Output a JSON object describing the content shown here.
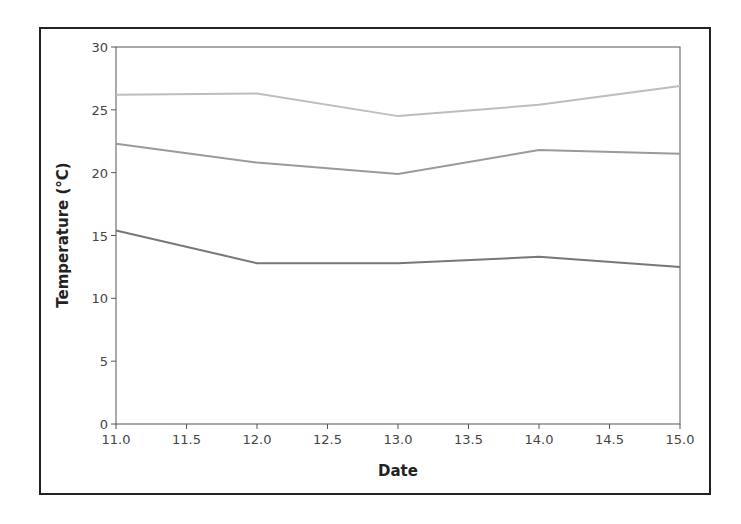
{
  "chart_data": {
    "type": "line",
    "title": "",
    "xlabel": "Date",
    "ylabel": "Temperature (°C)",
    "xlim": [
      11.0,
      15.0
    ],
    "ylim": [
      0,
      30
    ],
    "x_ticks": [
      "11.0",
      "11.5",
      "12.0",
      "12.5",
      "13.0",
      "13.5",
      "14.0",
      "14.5",
      "15.0"
    ],
    "y_ticks": [
      "0",
      "5",
      "10",
      "15",
      "20",
      "25",
      "30"
    ],
    "grid": false,
    "legend": null,
    "x": [
      11,
      12,
      13,
      14,
      15
    ],
    "series": [
      {
        "name": "series-1",
        "color": "#bdbdbd",
        "values": [
          26.2,
          26.3,
          24.5,
          25.4,
          26.9
        ]
      },
      {
        "name": "series-2",
        "color": "#9a9a9a",
        "values": [
          22.3,
          20.8,
          19.9,
          21.8,
          21.5
        ]
      },
      {
        "name": "series-3",
        "color": "#777777",
        "values": [
          15.4,
          12.8,
          12.8,
          13.3,
          12.5
        ]
      }
    ]
  }
}
